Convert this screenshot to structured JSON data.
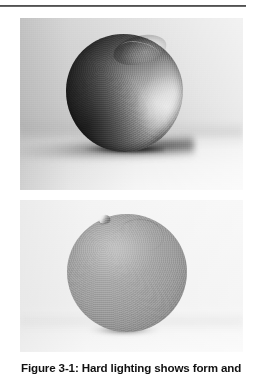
{
  "page": {
    "background_color": "#ffffff",
    "header_rule_color": "#3a3a3a"
  },
  "figure": {
    "caption": "Figure 3-1: Hard lighting shows form and",
    "number": "3-1"
  },
  "photos": [
    {
      "id": "photo-hard",
      "subject": "orange",
      "lighting": "hard",
      "description": "Black and white photograph of a single orange lit by a hard directional light from the right, producing deep shadow across the left of the fruit and a long dark cast shadow on the surface.",
      "shadow": "long hard-edged cast shadow to the left",
      "background_tone": "#d9d9d9"
    },
    {
      "id": "photo-soft",
      "subject": "orange",
      "lighting": "soft",
      "description": "Black and white photograph of the same orange under soft even lighting, rendering the fruit flat and low in contrast with only a small contact shadow beneath it.",
      "shadow": "small soft contact shadow beneath the fruit",
      "background_tone": "#f2f2f2"
    }
  ]
}
